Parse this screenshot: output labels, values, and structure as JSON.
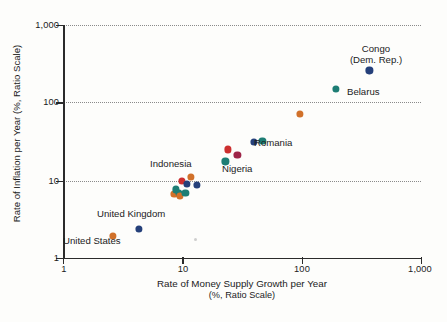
{
  "chart_data": {
    "type": "scatter",
    "title": "",
    "xlabel": "Rate of Money Supply Growth per Year",
    "xlabel_line2": "(%, Ratio Scale)",
    "ylabel": "Rate of Inflation per Year (%, Ratio Scale)",
    "xscale": "log",
    "yscale": "log",
    "xlim": [
      1,
      1000
    ],
    "ylim": [
      1,
      1000
    ],
    "xticks": [
      1,
      10,
      100,
      1000
    ],
    "xtick_labels": [
      "1",
      "10",
      "100",
      "1,000"
    ],
    "yticks": [
      1,
      10,
      100,
      1000
    ],
    "ytick_labels": [
      "1",
      "10",
      "100",
      "1,000"
    ],
    "grid": "horizontal-dotted",
    "legend": "none",
    "colors": {
      "navy": "#25407a",
      "teal": "#1d7d74",
      "orange": "#d1712a",
      "red": "#cc2f2f",
      "maroon": "#9e2548",
      "axis": "#2b2b2b",
      "grid": "#8a8a8a",
      "background": "#fdfdfb"
    },
    "points": [
      {
        "label": "United States",
        "x": 2.6,
        "y": 1.9,
        "color": "#d1712a"
      },
      {
        "label": "United Kingdom",
        "x": 4.3,
        "y": 2.35,
        "color": "#25407a"
      },
      {
        "label": "",
        "x": 8.6,
        "y": 6.6,
        "color": "#d1712a"
      },
      {
        "label": "",
        "x": 8.8,
        "y": 7.6,
        "color": "#1d7d74"
      },
      {
        "label": "",
        "x": 9.3,
        "y": 6.9,
        "color": "#1d7d74"
      },
      {
        "label": "",
        "x": 9.9,
        "y": 9.8,
        "color": "#cc2f2f"
      },
      {
        "label": "",
        "x": 9.6,
        "y": 6.3,
        "color": "#d1712a"
      },
      {
        "label": "",
        "x": 10.6,
        "y": 6.8,
        "color": "#1d7d74"
      },
      {
        "label": "",
        "x": 11.0,
        "y": 8.9,
        "color": "#25407a"
      },
      {
        "label": "Indonesia",
        "x": 11.8,
        "y": 11.0,
        "color": "#d1712a"
      },
      {
        "label": "",
        "x": 13.2,
        "y": 8.6,
        "color": "#25407a"
      },
      {
        "label": "",
        "x": 23.0,
        "y": 17.5,
        "color": "#1d7d74"
      },
      {
        "label": "Nigeria",
        "x": 24.0,
        "y": 25.0,
        "color": "#cc2f2f"
      },
      {
        "label": "",
        "x": 29.0,
        "y": 21.0,
        "color": "#9e2548"
      },
      {
        "label": "",
        "x": 40.0,
        "y": 31.0,
        "color": "#25407a"
      },
      {
        "label": "Romania",
        "x": 47.0,
        "y": 32.0,
        "color": "#1d7d74"
      },
      {
        "label": "",
        "x": 97.0,
        "y": 72.0,
        "color": "#d1712a"
      },
      {
        "label": "Belarus",
        "x": 195.0,
        "y": 150.0,
        "color": "#1d7d74"
      },
      {
        "label": "Congo (Dem. Rep.)",
        "x": 370.0,
        "y": 260.0,
        "color": "#25407a"
      }
    ],
    "annotations": [
      {
        "name": "congo",
        "text": "Congo",
        "text2": "(Dem. Rep.)"
      },
      {
        "name": "belarus",
        "text": "Belarus"
      },
      {
        "name": "romania",
        "text": "Romania"
      },
      {
        "name": "nigeria",
        "text": "Nigeria"
      },
      {
        "name": "indonesia",
        "text": "Indonesia"
      },
      {
        "name": "united-kingdom",
        "text": "United Kingdom"
      },
      {
        "name": "united-states",
        "text": "United States"
      }
    ]
  }
}
